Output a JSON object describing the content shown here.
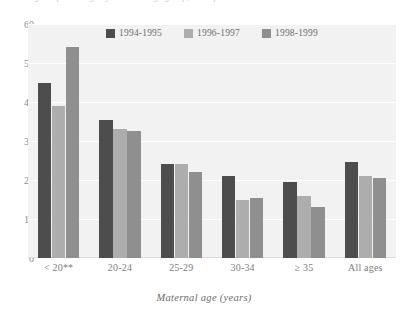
{
  "caption": {
    "clipped_text": "Figure: percentage by maternal age group, three periods"
  },
  "chart_data": {
    "type": "bar",
    "title": "",
    "xlabel": "Maternal age (years)",
    "ylabel": "",
    "categories": [
      "< 20**",
      "20-24",
      "25-29",
      "30-34",
      "≥ 35",
      "All ages"
    ],
    "ylim": [
      0,
      60
    ],
    "yticks": [
      0,
      10,
      20,
      30,
      40,
      50,
      60
    ],
    "grid": true,
    "legend_position": "top-center",
    "series": [
      {
        "name": "1994-1995",
        "color": "#4d4d4d",
        "values": [
          45,
          35.5,
          24,
          21,
          19.5,
          24.5
        ]
      },
      {
        "name": "1996-1997",
        "color": "#adadad",
        "values": [
          39,
          33,
          24,
          15,
          16,
          21
        ]
      },
      {
        "name": "1998-1999",
        "color": "#8f8f8f",
        "values": [
          54,
          32.5,
          22,
          15.5,
          13,
          20.5
        ]
      }
    ]
  },
  "colors": {
    "panel_background": "#f2f2f2",
    "gridline": "#ffffff",
    "axis_text": "#7d7d7d"
  }
}
